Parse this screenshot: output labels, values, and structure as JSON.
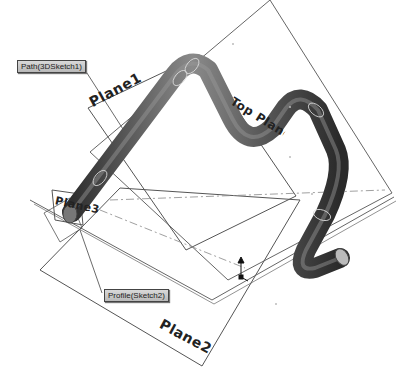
{
  "viewport": {
    "background": "#ffffff",
    "line_color": "#555555",
    "pipe_color_dark": "#3a3a3a",
    "pipe_color_mid": "#7a7a7a",
    "pipe_color_light": "#c8c8c8"
  },
  "callouts": {
    "path": "Path(3DSketch1)",
    "profile": "Profile(Sketch2)"
  },
  "planes": {
    "plane1": "Plane1",
    "plane2": "Plane2",
    "plane3": "Plane3",
    "top_plane": "Top Plane"
  },
  "icons": {
    "origin_triad": "origin-icon"
  }
}
